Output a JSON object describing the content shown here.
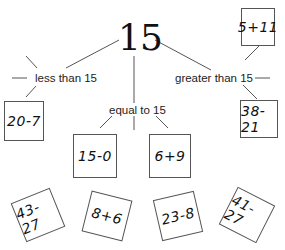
{
  "root": {
    "value": "15"
  },
  "categories": [
    {
      "id": "less",
      "label": "less than 15"
    },
    {
      "id": "equal",
      "label": "equal to 15"
    },
    {
      "id": "greater",
      "label": "greater than 15"
    }
  ],
  "cards": {
    "less_than": [
      "20-7"
    ],
    "equal_to": [
      "15-0",
      "6+9"
    ],
    "greater_than": [
      "5+11",
      "38-21"
    ],
    "unsorted": [
      "43-27",
      "8+6",
      "23-8",
      "41-27"
    ]
  },
  "colors": {
    "line": "#555555",
    "text": "#111111",
    "background": "#ffffff"
  }
}
